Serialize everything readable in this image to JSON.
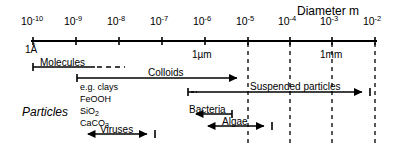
{
  "figure": {
    "header": "Diameter  m",
    "group_label": "Particles",
    "angstrom_label": "1Å",
    "unit_markers": [
      {
        "text": "1µm",
        "x": 192,
        "y": 50
      },
      {
        "text": "1mm",
        "x": 320,
        "y": 50
      }
    ]
  },
  "axis": {
    "type": "log10",
    "min_exponent": -10,
    "max_exponent": -2,
    "unit": "m",
    "tick_exponents": [
      -10,
      -9,
      -8,
      -7,
      -6,
      -5,
      -4,
      -3,
      -2
    ],
    "tick_labels": [
      "10-10",
      "10-9",
      "10-8",
      "10-7",
      "10-6",
      "10-5",
      "10-4",
      "10-3",
      "10-2"
    ],
    "mantissa": "10",
    "exponents": [
      "-10",
      "-9",
      "-8",
      "-7",
      "-6",
      "-5",
      "-4",
      "-3",
      "-2"
    ],
    "tick_x": [
      33,
      76,
      119,
      162,
      205,
      248,
      290,
      332,
      375
    ],
    "axis_y": 41,
    "label_y": 16
  },
  "gridlines": {
    "style": "dashed",
    "exponents": [
      -5,
      -4,
      -3,
      -2
    ],
    "x": [
      248,
      290,
      332,
      375
    ],
    "top": 43,
    "bottom": 146
  },
  "ranges": [
    {
      "name": "Molecules",
      "label": "Molecules",
      "x1": 33,
      "x2": 95,
      "dashed_to": 125,
      "y": 67,
      "label_x": 40,
      "label_y": 58,
      "left_cap": "bar",
      "right_cap": "dashed",
      "range_exponents": [
        -10,
        -8.5
      ]
    },
    {
      "name": "Colloids",
      "label": "Colloids",
      "x1": 77,
      "x2": 245,
      "y": 78,
      "label_x": 148,
      "label_y": 68,
      "left_cap": "bar",
      "right_cap": "arrow",
      "range_exponents": [
        -9,
        -5
      ]
    },
    {
      "name": "Suspended particles",
      "label": "Suspended particles",
      "x1": 188,
      "x2": 370,
      "y": 92,
      "label_x": 250,
      "label_y": 82,
      "left_cap": "bar-dash",
      "right_cap": "arrow-bar",
      "range_exponents": [
        -6.4,
        -2.1
      ]
    },
    {
      "name": "Bacteria",
      "label": "Bacteria",
      "x1": 188,
      "x2": 232,
      "y": 114,
      "label_x": 189,
      "label_y": 105,
      "left_cap": "arrow",
      "right_cap": "bar",
      "range_exponents": [
        -6.4,
        -5.4
      ]
    },
    {
      "name": "Algae",
      "label": "Algae",
      "x1": 200,
      "x2": 272,
      "y": 126,
      "label_x": 222,
      "label_y": 117,
      "left_cap": "arrow",
      "right_cap": "arrow-bar",
      "range_exponents": [
        -6.1,
        -4.4
      ]
    },
    {
      "name": "Viruses",
      "label": "Viruses",
      "x1": 80,
      "x2": 155,
      "y": 134,
      "label_x": 100,
      "label_y": 125,
      "left_cap": "arrow",
      "right_cap": "arrow-bar",
      "range_exponents": [
        -8.9,
        -7.2
      ]
    }
  ],
  "mineral_examples": [
    {
      "text": "e.g. clays",
      "x": 80,
      "y": 83
    },
    {
      "text": "FeOOH",
      "x": 80,
      "y": 95
    },
    {
      "text": "SiO2",
      "html": "SiO<sub>2</sub>",
      "x": 80,
      "y": 107
    },
    {
      "text": "CaCO3",
      "html": "CaCO<sub>3</sub>",
      "x": 80,
      "y": 119
    }
  ],
  "group_label_pos": {
    "x": 22,
    "y": 106
  },
  "header_pos": {
    "x": 297,
    "y": 5
  },
  "angstrom_pos": {
    "x": 25,
    "y": 45
  },
  "colors": {
    "ink": "#000000",
    "background": "#ffffff"
  }
}
